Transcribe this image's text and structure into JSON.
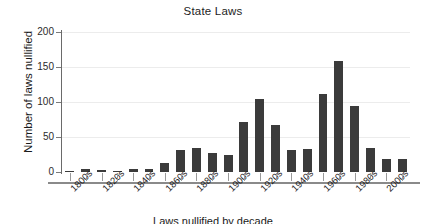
{
  "chart_data": {
    "type": "bar",
    "title": "State Laws",
    "xlabel": "Laws nullified by decade",
    "ylabel": "Number of laws nullified",
    "ylim": [
      0,
      200
    ],
    "yticks": [
      0,
      50,
      100,
      150,
      200
    ],
    "ytick_labels": [
      "0",
      "50",
      "100",
      "150",
      "200"
    ],
    "grid": true,
    "grid_axis": "y",
    "legend": "none",
    "bar_color": "#3b3b3b",
    "categories": [
      "1800s",
      "1810s",
      "1820s",
      "1830s",
      "1840s",
      "1850s",
      "1860s",
      "1870s",
      "1880s",
      "1890s",
      "1900s",
      "1910s",
      "1920s",
      "1930s",
      "1940s",
      "1950s",
      "1960s",
      "1970s",
      "1980s",
      "1990s",
      "2000s",
      "2010s"
    ],
    "xtick_labels": [
      "1800s",
      "",
      "1820s",
      "",
      "1840s",
      "",
      "1860s",
      "",
      "1880s",
      "",
      "1900s",
      "",
      "1920s",
      "",
      "1940s",
      "",
      "1960s",
      "",
      "1980s",
      "",
      "2000s",
      ""
    ],
    "values": [
      1,
      5,
      3,
      1,
      5,
      4,
      13,
      31,
      35,
      27,
      25,
      72,
      104,
      67,
      31,
      33,
      111,
      159,
      95,
      34,
      19,
      19
    ]
  }
}
